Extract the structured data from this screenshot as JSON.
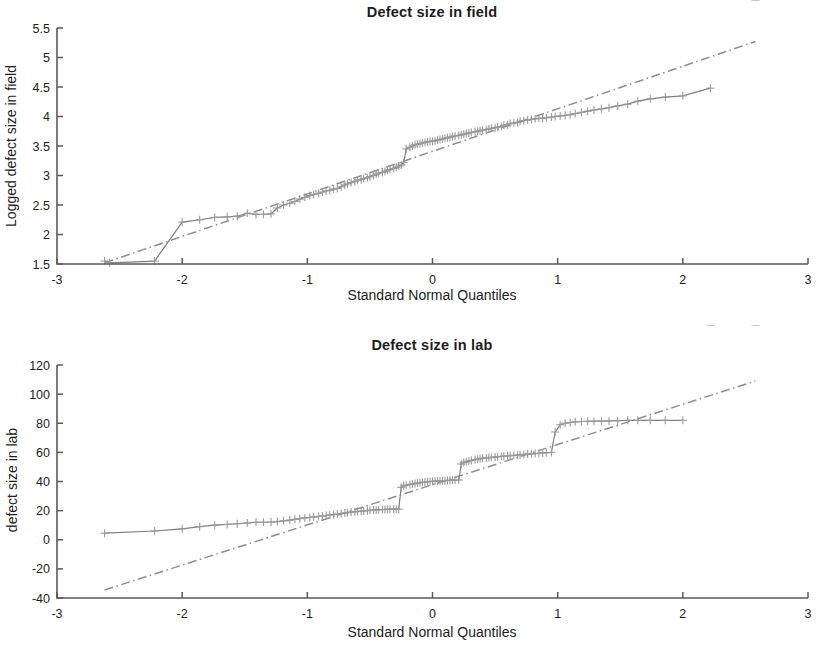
{
  "figure": {
    "background": "#ffffff",
    "marker_color": "#9a9a9a",
    "line_color": "#8d8d8d",
    "axis_color": "#5a5a5a"
  },
  "panels": [
    {
      "id": "top",
      "title": "Defect size in field",
      "xlabel": "Standard Normal Quantiles",
      "ylabel": "Logged defect size in field",
      "xticks": [
        "-3",
        "-2",
        "-1",
        "0",
        "1",
        "2",
        "3"
      ],
      "yticks": [
        "1.5",
        "2",
        "2.5",
        "3",
        "3.5",
        "4",
        "4.5",
        "5",
        "5.5"
      ]
    },
    {
      "id": "bottom",
      "title": "Defect size in lab",
      "xlabel": "Standard Normal Quantiles",
      "ylabel": "defect size in lab",
      "xticks": [
        "-3",
        "-2",
        "-1",
        "0",
        "1",
        "2",
        "3"
      ],
      "yticks": [
        "-40",
        "-20",
        "0",
        "20",
        "40",
        "60",
        "80",
        "100",
        "120"
      ]
    }
  ],
  "chart_data": [
    {
      "type": "scatter",
      "panel": "top",
      "title": "Defect size in field",
      "xlabel": "Standard Normal Quantiles",
      "ylabel": "Logged defect size in field",
      "xlim": [
        -3,
        3
      ],
      "ylim": [
        1.5,
        5.5
      ],
      "xticks": [
        -3,
        -2,
        -1,
        0,
        1,
        2,
        3
      ],
      "yticks": [
        1.5,
        2,
        2.5,
        3,
        3.5,
        4,
        4.5,
        5,
        5.5
      ],
      "grid": false,
      "legend": "none",
      "marker": "plus",
      "series": [
        {
          "name": "Sample data quantiles",
          "x": [
            -2.62,
            -2.58,
            -2.22,
            -2.0,
            -1.86,
            -1.74,
            -1.64,
            -1.56,
            -1.48,
            -1.41,
            -1.35,
            -1.29,
            -1.24,
            -1.19,
            -1.14,
            -1.1,
            -1.06,
            -1.02,
            -0.98,
            -0.95,
            -0.91,
            -0.88,
            -0.85,
            -0.82,
            -0.79,
            -0.76,
            -0.73,
            -0.7,
            -0.68,
            -0.65,
            -0.62,
            -0.6,
            -0.57,
            -0.55,
            -0.52,
            -0.5,
            -0.47,
            -0.45,
            -0.43,
            -0.4,
            -0.38,
            -0.36,
            -0.34,
            -0.31,
            -0.29,
            -0.27,
            -0.25,
            -0.23,
            -0.21,
            -0.18,
            -0.16,
            -0.14,
            -0.12,
            -0.1,
            -0.08,
            -0.06,
            -0.04,
            -0.02,
            0.0,
            0.02,
            0.04,
            0.06,
            0.08,
            0.1,
            0.12,
            0.14,
            0.16,
            0.18,
            0.21,
            0.23,
            0.25,
            0.27,
            0.29,
            0.31,
            0.34,
            0.36,
            0.38,
            0.4,
            0.43,
            0.45,
            0.47,
            0.5,
            0.52,
            0.55,
            0.57,
            0.6,
            0.62,
            0.65,
            0.68,
            0.7,
            0.73,
            0.76,
            0.79,
            0.82,
            0.85,
            0.88,
            0.91,
            0.95,
            0.98,
            1.02,
            1.06,
            1.1,
            1.14,
            1.19,
            1.24,
            1.29,
            1.35,
            1.41,
            1.48,
            1.56,
            1.64,
            1.74,
            1.86,
            2.0,
            2.22,
            2.58
          ],
          "y": [
            1.55,
            1.52,
            1.55,
            2.21,
            2.25,
            2.29,
            2.3,
            2.31,
            2.36,
            2.34,
            2.34,
            2.35,
            2.45,
            2.5,
            2.53,
            2.56,
            2.6,
            2.63,
            2.66,
            2.68,
            2.7,
            2.72,
            2.74,
            2.75,
            2.77,
            2.78,
            2.81,
            2.84,
            2.86,
            2.88,
            2.9,
            2.92,
            2.93,
            2.95,
            2.96,
            2.98,
            3.0,
            3.02,
            3.04,
            3.05,
            3.07,
            3.09,
            3.1,
            3.12,
            3.14,
            3.16,
            3.18,
            3.22,
            3.45,
            3.48,
            3.5,
            3.52,
            3.53,
            3.54,
            3.55,
            3.56,
            3.57,
            3.58,
            3.58,
            3.59,
            3.6,
            3.61,
            3.62,
            3.63,
            3.64,
            3.65,
            3.66,
            3.67,
            3.68,
            3.69,
            3.7,
            3.71,
            3.72,
            3.73,
            3.74,
            3.75,
            3.76,
            3.77,
            3.78,
            3.79,
            3.8,
            3.81,
            3.82,
            3.83,
            3.85,
            3.86,
            3.88,
            3.89,
            3.9,
            3.92,
            3.93,
            3.94,
            3.95,
            3.96,
            3.97,
            3.97,
            3.98,
            3.99,
            4.0,
            4.01,
            4.02,
            4.03,
            4.05,
            4.07,
            4.09,
            4.11,
            4.13,
            4.15,
            4.18,
            4.21,
            4.26,
            4.3,
            4.33,
            4.35,
            4.48
          ]
        }
      ],
      "reference_line": {
        "style": "dash-dot",
        "x": [
          -2.62,
          2.58
        ],
        "y": [
          1.52,
          5.27
        ]
      },
      "fit_line": {
        "style": "solid",
        "x": [
          -1.95,
          1.1
        ],
        "y": [
          2.28,
          4.03
        ]
      }
    },
    {
      "type": "scatter",
      "panel": "bottom",
      "title": "Defect size in lab",
      "xlabel": "Standard Normal Quantiles",
      "ylabel": "defect size in lab",
      "xlim": [
        -3,
        3
      ],
      "ylim": [
        -40,
        120
      ],
      "xticks": [
        -3,
        -2,
        -1,
        0,
        1,
        2,
        3
      ],
      "yticks": [
        -40,
        -20,
        0,
        20,
        40,
        60,
        80,
        100,
        120
      ],
      "grid": false,
      "legend": "none",
      "marker": "plus",
      "series": [
        {
          "name": "Sample data quantiles",
          "x": [
            -2.62,
            -2.22,
            -2.0,
            -1.86,
            -1.74,
            -1.64,
            -1.56,
            -1.48,
            -1.41,
            -1.35,
            -1.29,
            -1.24,
            -1.19,
            -1.14,
            -1.1,
            -1.06,
            -1.02,
            -0.98,
            -0.95,
            -0.91,
            -0.88,
            -0.85,
            -0.82,
            -0.79,
            -0.76,
            -0.73,
            -0.7,
            -0.68,
            -0.65,
            -0.62,
            -0.6,
            -0.57,
            -0.55,
            -0.52,
            -0.5,
            -0.47,
            -0.45,
            -0.43,
            -0.4,
            -0.38,
            -0.36,
            -0.34,
            -0.31,
            -0.29,
            -0.27,
            -0.25,
            -0.23,
            -0.21,
            -0.18,
            -0.16,
            -0.14,
            -0.12,
            -0.1,
            -0.08,
            -0.06,
            -0.04,
            -0.02,
            0.0,
            0.02,
            0.04,
            0.06,
            0.08,
            0.1,
            0.12,
            0.14,
            0.16,
            0.18,
            0.21,
            0.23,
            0.25,
            0.27,
            0.29,
            0.31,
            0.34,
            0.36,
            0.38,
            0.4,
            0.43,
            0.45,
            0.47,
            0.5,
            0.52,
            0.55,
            0.57,
            0.6,
            0.62,
            0.65,
            0.68,
            0.7,
            0.73,
            0.76,
            0.79,
            0.82,
            0.85,
            0.88,
            0.91,
            0.95,
            0.98,
            1.02,
            1.06,
            1.1,
            1.14,
            1.19,
            1.24,
            1.29,
            1.35,
            1.41,
            1.48,
            1.56,
            1.64,
            1.74,
            1.86,
            2.0,
            2.22,
            2.58
          ],
          "y": [
            4.5,
            6.0,
            7.5,
            9.0,
            10.0,
            10.5,
            11.0,
            11.5,
            12.0,
            12.0,
            12.2,
            12.5,
            13.0,
            13.5,
            14.0,
            14.5,
            15.0,
            15.3,
            15.6,
            16.0,
            16.3,
            16.6,
            17.0,
            17.3,
            17.6,
            18.0,
            18.3,
            18.6,
            19.0,
            19.2,
            19.4,
            19.6,
            19.8,
            20.0,
            20.2,
            20.4,
            20.5,
            20.6,
            20.7,
            20.8,
            20.9,
            21.0,
            21.0,
            21.0,
            21.0,
            36.0,
            37.0,
            37.5,
            38.0,
            38.3,
            38.6,
            39.0,
            39.2,
            39.4,
            39.6,
            39.8,
            40.0,
            40.1,
            40.2,
            40.3,
            40.4,
            40.5,
            40.6,
            40.7,
            40.8,
            41.0,
            41.0,
            41.0,
            52.0,
            53.0,
            53.5,
            54.0,
            54.5,
            55.0,
            55.3,
            55.6,
            56.0,
            56.2,
            56.4,
            56.6,
            56.8,
            57.0,
            57.2,
            57.4,
            57.6,
            57.8,
            58.0,
            58.2,
            58.4,
            58.6,
            58.8,
            59.0,
            59.2,
            59.4,
            59.6,
            59.8,
            60.0,
            74.0,
            79.0,
            80.0,
            80.5,
            81.0,
            81.2,
            81.3,
            81.4,
            81.5,
            81.6,
            81.8,
            82.0,
            82.0,
            82.0,
            82.0,
            82.0
          ]
        }
      ],
      "reference_line": {
        "style": "dash-dot",
        "x": [
          -2.62,
          2.58
        ],
        "y": [
          -34.5,
          109.0
        ]
      },
      "fit_line": {
        "style": "solid",
        "x": [
          -0.92,
          1.1
        ],
        "y": [
          16.0,
          80.0
        ]
      }
    }
  ]
}
